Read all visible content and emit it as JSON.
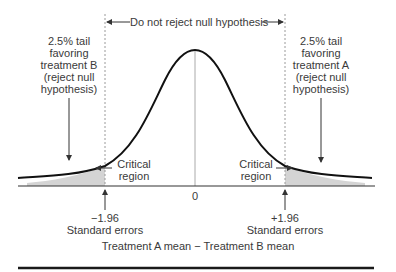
{
  "region_label": "Do not reject null hypothesis",
  "left_tail": {
    "lines": [
      "2.5% tail",
      "favoring",
      "treatment B",
      "(reject null",
      "hypothesis)"
    ]
  },
  "right_tail": {
    "lines": [
      "2.5% tail",
      "favoring",
      "treatment A",
      "(reject null",
      "hypothesis)"
    ]
  },
  "critical_left": {
    "lines": [
      "Critical",
      "region"
    ]
  },
  "critical_right": {
    "lines": [
      "Critical",
      "region"
    ]
  },
  "center_tick": "0",
  "left_cutoff": {
    "value": "−1.96",
    "unit": "Standard errors"
  },
  "right_cutoff": {
    "value": "+1.96",
    "unit": "Standard errors"
  },
  "x_axis_label": "Treatment A mean − Treatment B mean",
  "colors": {
    "curve": "#111111",
    "shade": "#d4d4d4",
    "dashed": "#9a9a9a",
    "text": "#3a3a3a",
    "rule": "#1a1a1a"
  }
}
